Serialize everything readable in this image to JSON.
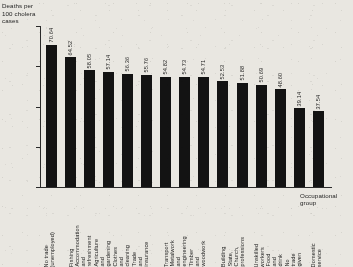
{
  "chart_data": {
    "type": "bar",
    "title": "",
    "ylabel": "Deaths per 100 cholera cases",
    "xlabel": "Occupational group",
    "ylim": [
      0,
      80
    ],
    "yticks": [
      0,
      20,
      40,
      60,
      80
    ],
    "ytick_labels": [
      "0",
      "20",
      "40",
      "60",
      "80"
    ],
    "grid": false,
    "legend": false,
    "bar_color": "#131313",
    "value_label_precision": 2,
    "categories": [
      "No trade (unemployed)",
      "Fishing",
      "Accommodation and refreshment",
      "Agriculture and gardening",
      "Clothes and cleaning",
      "Trade and insurance",
      "Transport",
      "Metalwork and engineering",
      "Timber and woodwork",
      "Building",
      "State, Church, professions",
      "Unskilled workers",
      "Food and drink",
      "No trade given",
      "Domestic service"
    ],
    "values": [
      70.64,
      64.52,
      58.05,
      57.14,
      56.36,
      55.76,
      54.82,
      54.73,
      54.71,
      52.53,
      51.88,
      50.69,
      48.6,
      39.14,
      37.54
    ],
    "value_labels": [
      "70.64",
      "64.52",
      "58.05",
      "57.14",
      "56.36",
      "55.76",
      "54.82",
      "54.73",
      "54.71",
      "52.53",
      "51.88",
      "50.69",
      "48.60",
      "39.14",
      "37.54"
    ],
    "category_labels_wrapped": [
      "No trade (unemployed)",
      "Fishing",
      "Accommodation\nand refreshment",
      "Agriculture and\ngardening",
      "Clothes and cleaning",
      "Trade and insurance",
      "Transport",
      "Metalwork and\nengineering",
      "Timber and woodwork",
      "Building",
      "State, Church, professions",
      "Unskilled workers",
      "Food and drink",
      "No trade given",
      "Domestic service"
    ]
  },
  "axes": {
    "y_title": "Deaths per\n100 cholera\ncases",
    "x_title": "Occupational\ngroup"
  }
}
